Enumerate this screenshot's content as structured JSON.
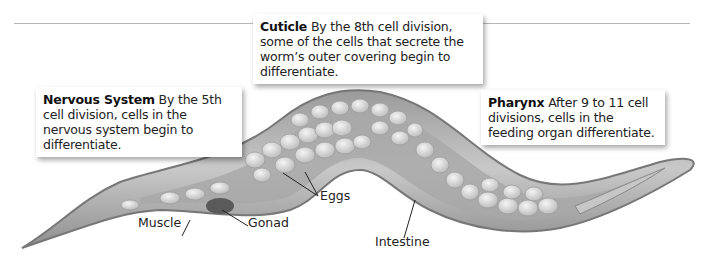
{
  "figure": {
    "callouts": [
      {
        "id": "nervous-system",
        "title": "Nervous System",
        "text": " By the 5th cell division, cells in the nervous system begin to differentiate."
      },
      {
        "id": "cuticle",
        "title": "Cuticle",
        "text": " By the 8th cell division, some of the cells that secrete the worm’s outer covering begin to differentiate."
      },
      {
        "id": "pharynx",
        "title": "Pharynx",
        "text": " After 9 to 11 cell divisions, cells in the feeding organ differentiate."
      }
    ],
    "labels": {
      "muscle": "Muscle",
      "gonad": "Gonad",
      "eggs": "Eggs",
      "intestine": "Intestine"
    },
    "colors": {
      "body_outer": "#8a8a8a",
      "body_fill": "#bdbdbd",
      "cells": "#e4e4e4",
      "gonad": "#555555",
      "callout_bg": "#ffffff"
    }
  }
}
